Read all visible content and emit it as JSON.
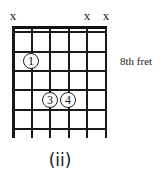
{
  "diagram": {
    "type": "guitar-chord-diagram",
    "caption": "(ii)",
    "position_label": "8th fret",
    "strings": 6,
    "frets_shown": 5,
    "muted_marker": "x",
    "muted_strings": [
      6,
      2,
      1
    ],
    "fingers": [
      {
        "finger": "1",
        "string": 5,
        "fret": 2
      },
      {
        "finger": "3",
        "string": 4,
        "fret": 4
      },
      {
        "finger": "4",
        "string": 3,
        "fret": 4
      }
    ],
    "colors": {
      "line": "#1a1a1a",
      "background": "#ffffff"
    }
  }
}
